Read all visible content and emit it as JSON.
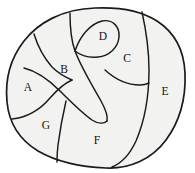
{
  "figure": {
    "colors": {
      "background": "#ffffff",
      "region_fill": "#f2f2f0",
      "curve_stroke": "#1a1a1a",
      "label_color": "#111111"
    },
    "label_count": 7,
    "regions": [
      {
        "id": "A",
        "label": "A",
        "x": 28,
        "y": 88,
        "position": "left"
      },
      {
        "id": "B",
        "label": "B",
        "x": 64,
        "y": 70,
        "position": "upper-center-left"
      },
      {
        "id": "C",
        "label": "C",
        "x": 127,
        "y": 59,
        "position": "upper-right"
      },
      {
        "id": "D",
        "label": "D",
        "x": 103,
        "y": 37,
        "position": "top-center-loop"
      },
      {
        "id": "E",
        "label": "E",
        "x": 165,
        "y": 92,
        "position": "right"
      },
      {
        "id": "F",
        "label": "F",
        "x": 97,
        "y": 141,
        "position": "bottom-center"
      },
      {
        "id": "G",
        "label": "G",
        "x": 46,
        "y": 126,
        "position": "lower-left"
      }
    ]
  }
}
